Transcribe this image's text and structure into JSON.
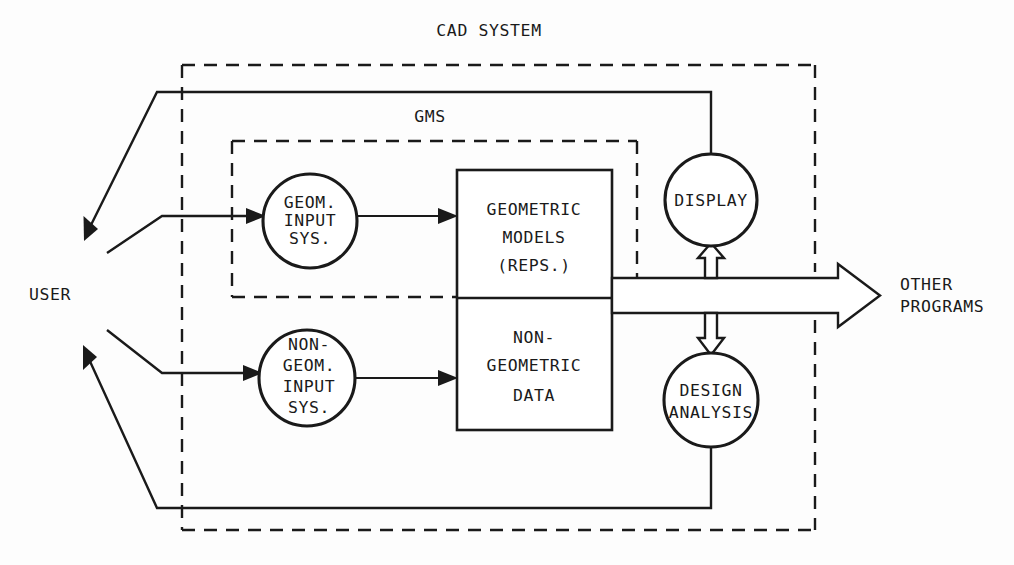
{
  "diagram": {
    "title": "CAD SYSTEM",
    "subsystem_title": "GMS",
    "actors": {
      "user": "USER",
      "other_programs_line1": "OTHER",
      "other_programs_line2": "PROGRAMS"
    },
    "nodes": {
      "geom_input": {
        "line1": "GEOM.",
        "line2": "INPUT",
        "line3": "SYS."
      },
      "nongeom_input": {
        "line1": "NON-",
        "line2": "GEOM.",
        "line3": "INPUT",
        "line4": "SYS."
      },
      "geometric_models": {
        "line1": "GEOMETRIC",
        "line2": "MODELS",
        "line3": "(REPS.)"
      },
      "nongeometric_data": {
        "line1": "NON-",
        "line2": "GEOMETRIC",
        "line3": "DATA"
      },
      "display": {
        "line1": "DISPLAY"
      },
      "design_analysis": {
        "line1": "DESIGN",
        "line2": "ANALYSIS"
      }
    },
    "colors": {
      "ink": "#1a1a1a",
      "paper": "#fdfdfd",
      "fill": "#ffffff"
    }
  }
}
